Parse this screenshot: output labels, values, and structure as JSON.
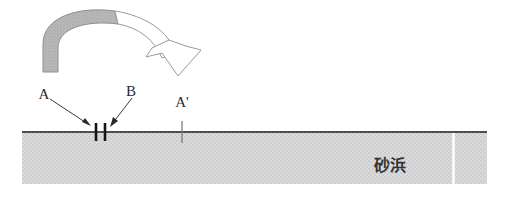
{
  "figure": {
    "background_color": "#ffffff"
  },
  "labels": {
    "a": "A",
    "b": "B",
    "a_prime": "A'",
    "beach": "砂浜"
  },
  "colors": {
    "sand_fill": "#d6d6d6",
    "sand_stipple": "#c4c4c4",
    "ground_line": "#4a4a4a",
    "arc_fill_gray": "#b3b3b3",
    "arc_outline": "#8c8c8c",
    "arrow_outline": "#9a9a9a",
    "marker_dark": "#1a1a1a",
    "marker_gray": "#8a8a8a",
    "text": "#2b2b2b",
    "divider_white": "#ffffff"
  },
  "geometry": {
    "sand": {
      "x": 22,
      "y": 131,
      "width": 465,
      "height": 53
    },
    "ground_line_y": 132,
    "sand_divider_x": 453,
    "marker_a_x": 96,
    "marker_b_x": 105,
    "marker_a_prime_x": 182,
    "arrow_tip": {
      "x": 178,
      "y": 76
    }
  },
  "annotations": {
    "arc_arrow_name": "curved-transport-arrow",
    "marker_a_name": "marker-a",
    "marker_b_name": "marker-b",
    "marker_a_prime_name": "marker-a-prime"
  }
}
